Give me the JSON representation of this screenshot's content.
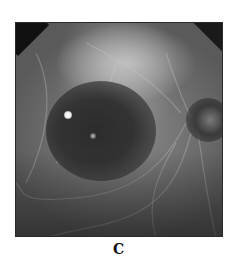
{
  "figure": {
    "panel_label": "C",
    "image_description": "Grayscale fluorescein angiography fundus image showing a large dark hypofluorescent lesion with bright punctate spots and the optic disc at right"
  }
}
